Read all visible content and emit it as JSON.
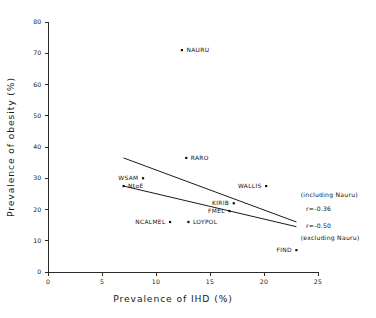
{
  "chart_data": {
    "type": "scatter",
    "title": "",
    "xlabel": "Prevalence of IHD (%)",
    "ylabel": "Prevalence of obesity (%)",
    "xlim": [
      0,
      25
    ],
    "ylim": [
      0,
      80
    ],
    "xticks": [
      0,
      5,
      10,
      15,
      20,
      25
    ],
    "yticks": [
      0,
      10,
      20,
      30,
      40,
      50,
      60,
      70,
      80
    ],
    "xtick_labels": [
      "0",
      "5",
      "10",
      "15",
      "20",
      "25"
    ],
    "ytick_labels": [
      "0",
      "10",
      "20",
      "30",
      "40",
      "50",
      "60",
      "70",
      "80"
    ],
    "grid": false,
    "legend": "none",
    "points": [
      {
        "label": "NAURU",
        "x": 12.4,
        "y": 71.0,
        "label_pos": "right"
      },
      {
        "label": "RARO",
        "x": 12.8,
        "y": 36.5,
        "label_pos": "right"
      },
      {
        "label": "WSAM",
        "x": 8.8,
        "y": 30.0,
        "label_pos": "left"
      },
      {
        "label": "NtoE",
        "x": 7.0,
        "y": 27.5,
        "label_pos": "right"
      },
      {
        "label": "WALLIS",
        "x": 20.2,
        "y": 27.5,
        "label_pos": "left"
      },
      {
        "label": "KIRIB",
        "x": 17.2,
        "y": 22.0,
        "label_pos": "left"
      },
      {
        "label": "FMEL",
        "x": 16.8,
        "y": 19.5,
        "label_pos": "left"
      },
      {
        "label": "LOYPOL",
        "x": 13.0,
        "y": 16.0,
        "label_pos": "right"
      },
      {
        "label": "NCALMEL",
        "x": 11.3,
        "y": 16.0,
        "label_pos": "left"
      },
      {
        "label": "FIND",
        "x": 23.0,
        "y": 7.0,
        "label_pos": "left"
      }
    ],
    "regression_lines": [
      {
        "name": "including Nauru",
        "r": "r=-0.36",
        "x_start": 7.0,
        "y_start": 36.5,
        "x_end": 23.0,
        "y_end": 16.0
      },
      {
        "name": "excluding Nauru",
        "r": "r=-0.50",
        "x_start": 7.0,
        "y_start": 27.5,
        "x_end": 23.0,
        "y_end": 14.5
      }
    ],
    "annotations": [
      {
        "text": "(including Nauru)",
        "x": 23.4,
        "y": 24.0
      },
      {
        "text": "r=-0.36",
        "x": 23.9,
        "y": 19.6
      },
      {
        "text": "r=-0.50",
        "x": 23.9,
        "y": 14.0
      },
      {
        "text": "(excluding Nauru)",
        "x": 23.4,
        "y": 10.2
      }
    ]
  },
  "colors": {
    "axis": "#2b2b2b",
    "marker": "#111111",
    "line": "#1a1a1a",
    "text": "#111111",
    "background": "#ffffff"
  }
}
